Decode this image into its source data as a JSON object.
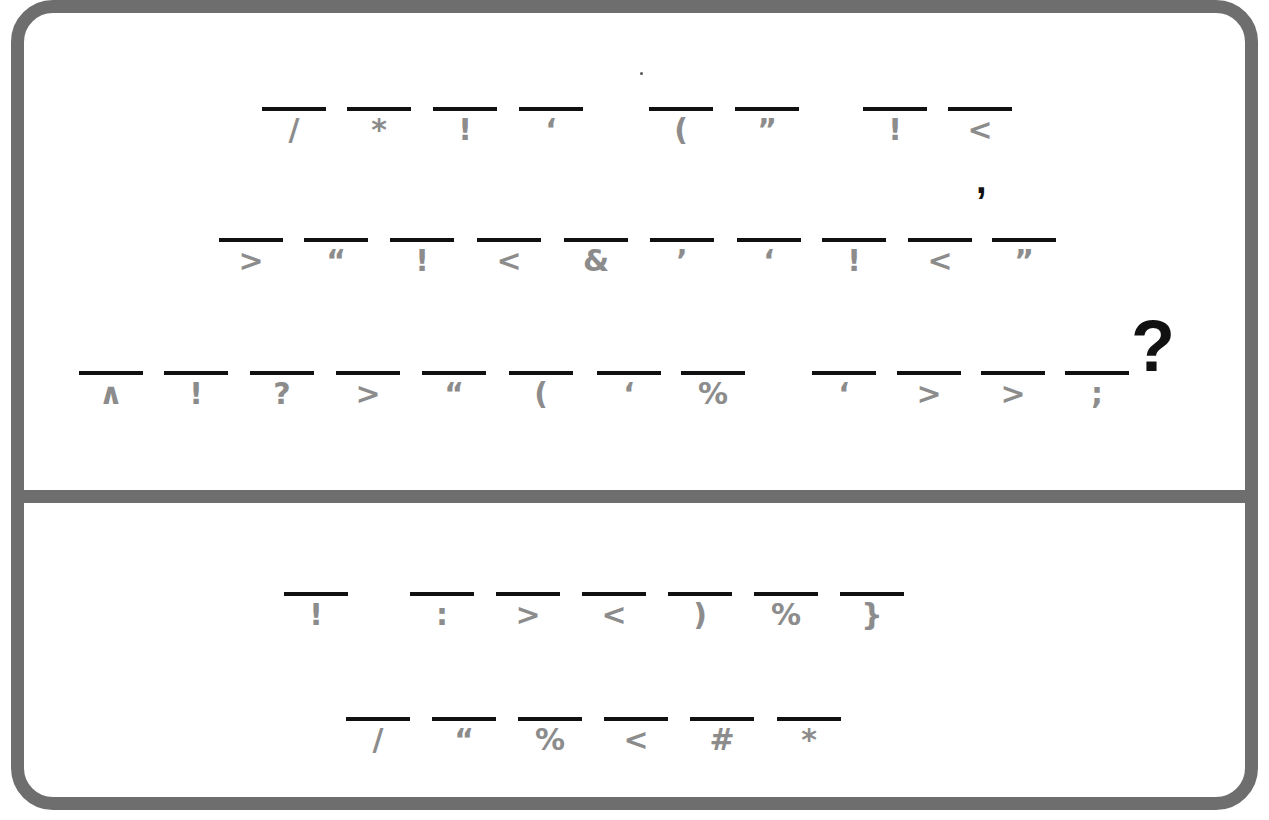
{
  "puzzle": {
    "type": "cryptogram",
    "colors": {
      "border": "#6e6e6e",
      "blank_line": "#111111",
      "cipher_glyph": "#8c8c8c",
      "punctuation": "#111111"
    },
    "clue": {
      "rows": [
        {
          "words": [
            {
              "cipher": [
                "/",
                "*",
                "!",
                "‘"
              ],
              "x": [
                262,
                347,
                433,
                519
              ]
            },
            {
              "cipher": [
                "(",
                "”"
              ],
              "x": [
                649,
                735
              ]
            },
            {
              "cipher": [
                "!",
                "<"
              ],
              "x": [
                863,
                948
              ]
            }
          ],
          "y": 107
        },
        {
          "words": [
            {
              "cipher": [
                ">",
                "“",
                "!",
                "<",
                "&",
                "’",
                "‘",
                "!",
                "<",
                "”"
              ],
              "x": [
                219,
                304,
                390,
                477,
                564,
                650,
                737,
                822,
                908,
                992
              ]
            }
          ],
          "y": 238
        },
        {
          "words": [
            {
              "cipher": [
                "∧",
                "!",
                "?",
                ">",
                "“",
                "(",
                "‘",
                "%"
              ],
              "x": [
                79,
                164,
                250,
                336,
                422,
                509,
                597,
                681
              ]
            },
            {
              "cipher": [
                "‘",
                ">",
                ">",
                ";"
              ],
              "x": [
                812,
                897,
                981,
                1065
              ]
            }
          ],
          "y": 371
        }
      ],
      "punctuation": [
        {
          "char": ",",
          "after_row": 0
        },
        {
          "char": "?",
          "after_row": 2
        }
      ]
    },
    "answer": {
      "rows": [
        {
          "words": [
            {
              "cipher": [
                "!"
              ],
              "x": [
                284
              ]
            },
            {
              "cipher": [
                ":",
                ">",
                "<",
                ")",
                "%",
                "}"
              ],
              "x": [
                410,
                496,
                582,
                668,
                754,
                840
              ]
            }
          ],
          "y": 592
        },
        {
          "words": [
            {
              "cipher": [
                "/",
                "“",
                "%",
                "<",
                "#",
                "*"
              ],
              "x": [
                346,
                432,
                518,
                604,
                690,
                777
              ]
            }
          ],
          "y": 717
        }
      ]
    }
  }
}
